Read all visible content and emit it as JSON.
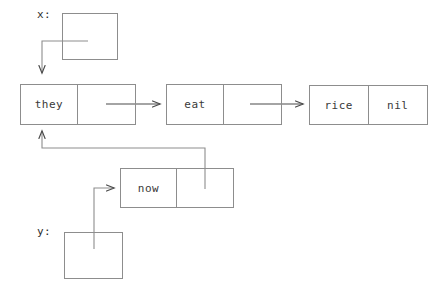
{
  "diagram": {
    "type": "linked-list-box-and-pointer",
    "stroke_color": "#8d8d8d",
    "text_color": "#3a3a3a",
    "variables": [
      {
        "name": "x",
        "label": "x:"
      },
      {
        "name": "y",
        "label": "y:"
      }
    ],
    "nodes": [
      {
        "id": "node-x-pointer",
        "kind": "variable-box",
        "variable": "x",
        "car": "",
        "cdr": ""
      },
      {
        "id": "node-they",
        "kind": "cons-cell",
        "car": "they",
        "cdr": ""
      },
      {
        "id": "node-eat",
        "kind": "cons-cell",
        "car": "eat",
        "cdr": ""
      },
      {
        "id": "node-rice",
        "kind": "cons-cell",
        "car": "rice",
        "cdr": "nil"
      },
      {
        "id": "node-now",
        "kind": "cons-cell",
        "car": "now",
        "cdr": ""
      },
      {
        "id": "node-y-pointer",
        "kind": "variable-box",
        "variable": "y",
        "car": "",
        "cdr": ""
      }
    ],
    "pointers": [
      {
        "id": "pointer-x-to-they",
        "from": "node-x-pointer",
        "to": "node-they"
      },
      {
        "id": "pointer-they-to-eat",
        "from": "node-they",
        "to": "node-eat"
      },
      {
        "id": "pointer-eat-to-rice",
        "from": "node-eat",
        "to": "node-rice"
      },
      {
        "id": "pointer-now-to-they",
        "from": "node-now",
        "to": "node-they"
      },
      {
        "id": "pointer-y-to-now",
        "from": "node-y-pointer",
        "to": "node-now"
      }
    ]
  }
}
